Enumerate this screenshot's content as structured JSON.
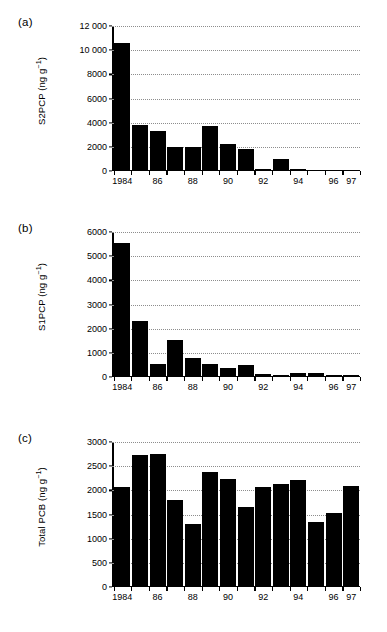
{
  "figure": {
    "panels": [
      {
        "id": "a",
        "label": "(a)",
        "ylabel_text": "S2PCP (ng g",
        "ylabel_sup": "−1",
        "ylabel_tail": ")",
        "ylabel_full": "S2PCP (ng g⁻¹)"
      },
      {
        "id": "b",
        "label": "(b)",
        "ylabel_text": "S1PCP (ng g",
        "ylabel_sup": "−1",
        "ylabel_tail": ")",
        "ylabel_full": "S1PCP (ng g⁻¹)"
      },
      {
        "id": "c",
        "label": "(c)",
        "ylabel_text": "Total PCB (ng g",
        "ylabel_sup": "−1",
        "ylabel_tail": ")",
        "ylabel_full": "Total PCB (ng g⁻¹)"
      }
    ]
  },
  "chart_data": [
    {
      "panel": "a",
      "type": "bar",
      "title": "",
      "xlabel": "",
      "ylabel": "S2PCP (ng g⁻¹)",
      "ylim": [
        0,
        12000
      ],
      "yticks": [
        0,
        2000,
        4000,
        6000,
        8000,
        10000,
        12000
      ],
      "ytick_labels": [
        "0",
        "2000",
        "4000",
        "6000",
        "8000",
        "10 000",
        "12 000"
      ],
      "grid": true,
      "legend": "none",
      "categories": [
        "1984",
        "1985",
        "1986",
        "1987",
        "1988",
        "1989",
        "1990",
        "1991",
        "1992",
        "1993",
        "1994",
        "1995",
        "1996",
        "1997"
      ],
      "xtick_labels": [
        "1984",
        "",
        "86",
        "",
        "88",
        "",
        "90",
        "",
        "92",
        "",
        "94",
        "",
        "96",
        "97"
      ],
      "values": [
        10500,
        3700,
        3200,
        1900,
        1900,
        3650,
        2150,
        1700,
        40,
        900,
        20,
        15,
        10,
        10
      ],
      "bar_color": "#000000"
    },
    {
      "panel": "b",
      "type": "bar",
      "title": "",
      "xlabel": "",
      "ylabel": "S1PCP (ng g⁻¹)",
      "ylim": [
        0,
        6000
      ],
      "yticks": [
        0,
        1000,
        2000,
        3000,
        4000,
        5000,
        6000
      ],
      "ytick_labels": [
        "0",
        "1000",
        "2000",
        "3000",
        "4000",
        "5000",
        "6000"
      ],
      "grid": true,
      "legend": "none",
      "categories": [
        "1984",
        "1985",
        "1986",
        "1987",
        "1988",
        "1989",
        "1990",
        "1991",
        "1992",
        "1993",
        "1994",
        "1995",
        "1996",
        "1997"
      ],
      "xtick_labels": [
        "1984",
        "",
        "86",
        "",
        "88",
        "",
        "90",
        "",
        "92",
        "",
        "94",
        "",
        "96",
        "97"
      ],
      "values": [
        5500,
        2280,
        500,
        1480,
        730,
        470,
        320,
        450,
        90,
        30,
        130,
        120,
        40,
        10
      ],
      "bar_color": "#000000"
    },
    {
      "panel": "c",
      "type": "bar",
      "title": "",
      "xlabel": "",
      "ylabel": "Total PCB (ng g⁻¹)",
      "ylim": [
        0,
        3000
      ],
      "yticks": [
        0,
        500,
        1000,
        1500,
        2000,
        2500,
        3000
      ],
      "ytick_labels": [
        "0",
        "500",
        "1000",
        "1500",
        "2000",
        "2500",
        "3000"
      ],
      "grid": true,
      "legend": "none",
      "categories": [
        "1984",
        "1985",
        "1986",
        "1987",
        "1988",
        "1989",
        "1990",
        "1991",
        "1992",
        "1993",
        "1994",
        "1995",
        "1996",
        "1997"
      ],
      "xtick_labels": [
        "1984",
        "",
        "86",
        "",
        "88",
        "",
        "90",
        "",
        "92",
        "",
        "94",
        "",
        "96",
        "97"
      ],
      "values": [
        2040,
        2700,
        2730,
        1770,
        1270,
        2350,
        2200,
        1620,
        2050,
        2110,
        2190,
        1310,
        1500,
        2070
      ],
      "bar_color": "#000000"
    }
  ]
}
